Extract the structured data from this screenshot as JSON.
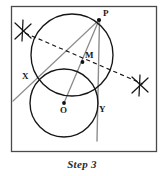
{
  "figure": {
    "caption": "Step 3",
    "frame": {
      "x": 11,
      "y": 6,
      "width": 146,
      "height": 146,
      "stroke": "#4a4a4a"
    },
    "colors": {
      "ink": "#1a1a1a",
      "construction_line": "#8a8a8a",
      "dashed_line": "#1a1a1a",
      "background": "#ffffff",
      "frame": "#4a4a4a"
    },
    "labels": [
      {
        "id": "P",
        "text": "P",
        "x": 103,
        "y": 10
      },
      {
        "id": "M",
        "text": "M",
        "x": 84,
        "y": 52
      },
      {
        "id": "X",
        "text": "X",
        "x": 22,
        "y": 73
      },
      {
        "id": "O",
        "text": "O",
        "x": 60,
        "y": 107
      },
      {
        "id": "Y",
        "text": "Y",
        "x": 99,
        "y": 106
      }
    ],
    "circles": [
      {
        "id": "big-circle",
        "cx": 72,
        "cy": 55,
        "r": 41,
        "stroke": "#1a1a1a",
        "width": 1.3
      },
      {
        "id": "small-circle",
        "cx": 64,
        "cy": 103,
        "r": 34,
        "stroke": "#1a1a1a",
        "width": 1.3
      }
    ],
    "points": [
      {
        "id": "P",
        "cx": 99,
        "cy": 20
      },
      {
        "id": "M",
        "cx": 82,
        "cy": 62
      },
      {
        "id": "O",
        "cx": 64,
        "cy": 103
      }
    ],
    "segments": [
      {
        "id": "segment-P-O",
        "x1": 99,
        "y1": 20,
        "x2": 64,
        "y2": 103,
        "stroke": "#8a8a8a",
        "width": 1.2
      },
      {
        "id": "line-P-X-extended",
        "x1": 99,
        "y1": 20,
        "x2": 13,
        "y2": 101,
        "stroke": "#8a8a8a",
        "width": 1.2
      },
      {
        "id": "vertical-line-P-Y",
        "x1": 99,
        "y1": 20,
        "x2": 97,
        "y2": 141,
        "stroke": "#8a8a8a",
        "width": 1.3
      }
    ],
    "dashed_lines": [
      {
        "id": "perpendicular-bisector",
        "x1": 25,
        "y1": 33,
        "x2": 143,
        "y2": 84,
        "stroke": "#1a1a1a",
        "width": 1.1,
        "dash": "4 3"
      }
    ],
    "arc_marks": [
      {
        "id": "arc-cross-upper-left",
        "cx": 23,
        "cy": 31
      },
      {
        "id": "arc-cross-lower-right",
        "cx": 140,
        "cy": 85
      }
    ]
  }
}
